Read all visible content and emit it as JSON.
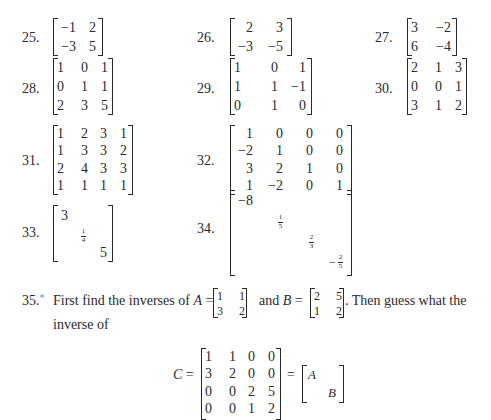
{
  "exercises": [
    {
      "number": "25.",
      "matrix": [
        [
          "−1",
          "2"
        ],
        [
          "−3",
          "5"
        ]
      ]
    },
    {
      "number": "26.",
      "matrix": [
        [
          "2",
          "3"
        ],
        [
          "−3",
          "−5"
        ]
      ]
    },
    {
      "number": "27.",
      "matrix": [
        [
          "3",
          "−2"
        ],
        [
          "6",
          "−4"
        ]
      ]
    },
    {
      "number": "28.",
      "matrix": [
        [
          "1",
          "0",
          "1"
        ],
        [
          "0",
          "1",
          "1"
        ],
        [
          "2",
          "3",
          "5"
        ]
      ]
    },
    {
      "number": "29.",
      "matrix": [
        [
          "1",
          "0",
          "1"
        ],
        [
          "1",
          "1",
          "−1"
        ],
        [
          "0",
          "1",
          "0"
        ]
      ]
    },
    {
      "number": "30.",
      "matrix": [
        [
          "2",
          "1",
          "3"
        ],
        [
          "0",
          "0",
          "1"
        ],
        [
          "3",
          "1",
          "2"
        ]
      ]
    },
    {
      "number": "31.",
      "matrix": [
        [
          "1",
          "2",
          "3",
          "1"
        ],
        [
          "1",
          "3",
          "3",
          "2"
        ],
        [
          "2",
          "4",
          "3",
          "3"
        ],
        [
          "1",
          "1",
          "1",
          "1"
        ]
      ]
    },
    {
      "number": "32.",
      "matrix": [
        [
          "1",
          "0",
          "0",
          "0"
        ],
        [
          "−2",
          "1",
          "0",
          "0"
        ],
        [
          "3",
          "2",
          "1",
          "0"
        ],
        [
          "1",
          "−2",
          "0",
          "1"
        ]
      ]
    },
    {
      "number": "33.",
      "diagonal": [
        "3",
        "1/4",
        "5"
      ]
    },
    {
      "number": "34.",
      "diagonal": [
        "−8",
        "1/5",
        "2/3",
        "−2/5"
      ]
    }
  ],
  "exercise35": {
    "number": "35.",
    "marker": "*",
    "marker_color": "#4a90d9",
    "text_part1": "First find the inverses of",
    "A_label": "A",
    "equals": "=",
    "A_matrix": [
      [
        "1",
        "1"
      ],
      [
        "3",
        "2"
      ]
    ],
    "and": "and",
    "B_label": "B",
    "B_matrix": [
      [
        "2",
        "5"
      ],
      [
        "1",
        "2"
      ]
    ],
    "text_part2": ". Then guess what the",
    "text_line2": "inverse of",
    "C_label": "C",
    "C_matrix": [
      [
        "1",
        "1",
        "0",
        "0"
      ],
      [
        "3",
        "2",
        "0",
        "0"
      ],
      [
        "0",
        "0",
        "2",
        "5"
      ],
      [
        "0",
        "0",
        "1",
        "2"
      ]
    ],
    "block_A": "A",
    "block_B": "B"
  }
}
